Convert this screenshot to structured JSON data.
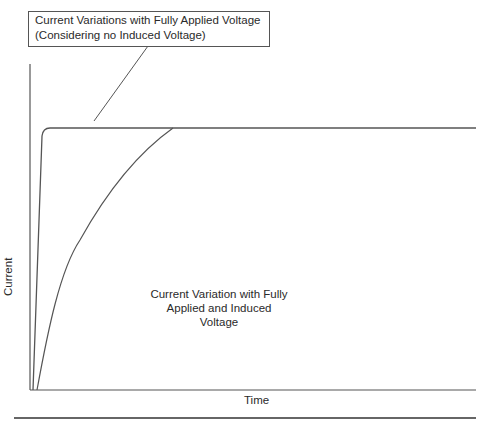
{
  "diagram": {
    "type": "current-vs-time",
    "callout": {
      "line1": "Current Variations with Fully Applied Voltage",
      "line2": "(Considering no Induced Voltage)"
    },
    "y_axis_label": "Current",
    "x_axis_label": "Time",
    "annotation": {
      "line1": "Current Variation with Fully",
      "line2": "Applied and Induced",
      "line3": "Voltage"
    },
    "curves": [
      {
        "name": "fully-applied-voltage",
        "shape": "near-instant rise to steady state"
      },
      {
        "name": "applied-and-induced-voltage",
        "shape": "exponential rise to steady state"
      }
    ],
    "colors": {
      "line": "#444444",
      "text": "#2a2a2a",
      "background": "#ffffff"
    }
  }
}
